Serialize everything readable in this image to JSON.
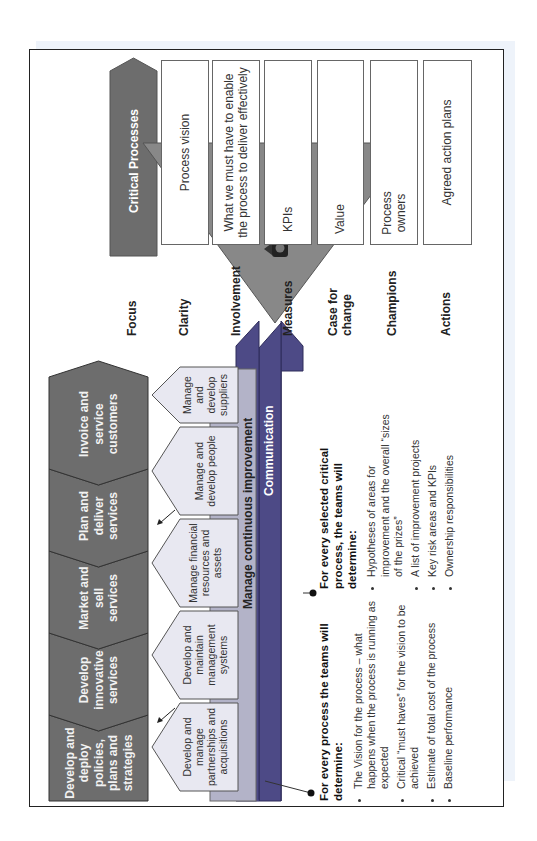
{
  "critical_processes": {
    "header": "Critical Processes",
    "rows": [
      {
        "label": "Focus",
        "box": ""
      },
      {
        "label": "Clarity",
        "box": "Process vision"
      },
      {
        "label": "Involvement",
        "box": "What we must have to enable the process to deliver effectively"
      },
      {
        "label": "Measures",
        "box": "KPIs",
        "icon": "traffic-light-icon",
        "icon_count": 3
      },
      {
        "label": "Case for change",
        "box": "Value",
        "icon": "scales-icon",
        "icon_count": 2
      },
      {
        "label": "Champions",
        "box": "Process owners",
        "icon": "keys-icon",
        "icon_count": 2
      },
      {
        "label": "Actions",
        "box": "Agreed action plans"
      }
    ]
  },
  "value_chain": {
    "core_processes": [
      "Develop and deploy policies, plans and strategies",
      "Develop innovative services",
      "Market and sell services",
      "Plan and deliver services",
      "Invoice and service customers"
    ],
    "support_processes": [
      "Develop and manage partnerships and acquisitions",
      "Develop and maintain management systems",
      "Manage financial resources and assets",
      "Manage and develop people",
      "Manage and develop suppliers"
    ],
    "bands": [
      "Manage continuous improvement",
      "Communication",
      "Values and policies",
      "Mission, Vision and CSFs"
    ]
  },
  "notes": {
    "every_process": {
      "title": "For every process the teams will determine:",
      "items": [
        "The Vision for the process – what happens when the process is running as expected",
        "Critical “must haves” for the vision to be achieved",
        "Estimate of total cost of the process",
        "Baseline performance"
      ]
    },
    "critical_process": {
      "title": "For every selected critical process, the teams will determine:",
      "items": [
        "Hypotheses of areas for improvement and the overall “sizes of the prizes”",
        "A list of improvement projects",
        "Key risk areas and KPIs",
        "Ownership responsibilities"
      ]
    }
  },
  "colors": {
    "dark_grey": "#6d6d6d",
    "light_pentagon": "#e8e8f1",
    "improvement_band": "#b3b3c8",
    "purple_band": "#4d4a86",
    "triangle": "#888888"
  }
}
